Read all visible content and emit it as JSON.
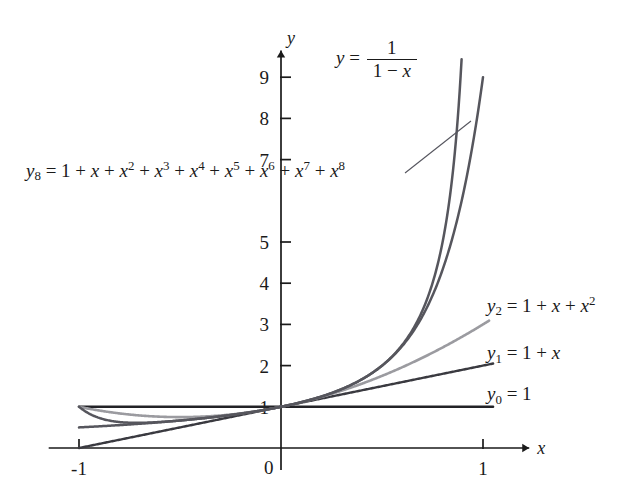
{
  "figure": {
    "background_color": "#ffffff",
    "axis_color": "#1a1a1a",
    "x_axis_name": "x",
    "y_axis_name": "y"
  },
  "labels": {
    "fraction": {
      "lhs": "y",
      "equals": "=",
      "numerator": "1",
      "denominator_one": "1",
      "denominator_minus": "−",
      "denominator_x": "x"
    },
    "y8": {
      "name": "y",
      "subscript": "8",
      "equals": "=",
      "t0": "1",
      "p1": "+",
      "t1": "x",
      "p2": "+",
      "t2": "x",
      "e2": "2",
      "p3": "+",
      "t3": "x",
      "e3": "3",
      "p4": "+",
      "t4": "x",
      "e4": "4",
      "p5": "+",
      "t5": "x",
      "e5": "5",
      "p6": "+",
      "t6": "x",
      "e6": "6",
      "p7": "+",
      "t7": "x",
      "e7": "7",
      "p8": "+",
      "t8": "x",
      "e8": "8"
    },
    "y2": {
      "name": "y",
      "subscript": "2",
      "equals": "=",
      "t0": "1",
      "p1": "+",
      "t1": "x",
      "p2": "+",
      "t2": "x",
      "e2": "2"
    },
    "y1": {
      "name": "y",
      "subscript": "1",
      "equals": "=",
      "t0": "1",
      "p1": "+",
      "t1": "x"
    },
    "y0": {
      "name": "y",
      "subscript": "0",
      "equals": "=",
      "t0": "1"
    }
  },
  "chart_data": {
    "type": "line",
    "title": "",
    "xlabel": "x",
    "ylabel": "y",
    "xlim": [
      -1.15,
      1.12
    ],
    "ylim": [
      -0.35,
      9.6
    ],
    "grid": false,
    "legend_position": "inline-annotations",
    "x_ticks": [
      -1,
      0,
      1
    ],
    "x_tick_labels": [
      "-1",
      "0",
      "1"
    ],
    "y_ticks": [
      1,
      2,
      3,
      4,
      5,
      6,
      7,
      8,
      9
    ],
    "y_tick_labels": [
      "1",
      "2",
      "3",
      "4",
      "5",
      "6",
      "7",
      "8",
      "9"
    ],
    "y_tick_labels_hidden": [
      "6"
    ],
    "series": [
      {
        "name": "y0 = 1",
        "expression": "1",
        "color": "#222226",
        "width": 2.4,
        "x_start": -1.0,
        "x_end": 1.05,
        "x": [
          -1,
          -0.75,
          -0.5,
          -0.25,
          0,
          0.25,
          0.5,
          0.75,
          1
        ],
        "values": [
          1,
          1,
          1,
          1,
          1,
          1,
          1,
          1,
          1
        ]
      },
      {
        "name": "y1 = 1 + x",
        "expression": "1+x",
        "color": "#3a3a40",
        "width": 2.4,
        "x_start": -1.0,
        "x_end": 1.05,
        "x": [
          -1,
          -0.75,
          -0.5,
          -0.25,
          0,
          0.25,
          0.5,
          0.75,
          1
        ],
        "values": [
          0,
          0.25,
          0.5,
          0.75,
          1,
          1.25,
          1.5,
          1.75,
          2
        ]
      },
      {
        "name": "y2 = 1 + x + x^2",
        "expression": "1+x+x^2",
        "color": "#9b9ba0",
        "width": 2.6,
        "x_start": -1.0,
        "x_end": 1.03,
        "x": [
          -1,
          -0.75,
          -0.5,
          -0.25,
          0,
          0.25,
          0.5,
          0.75,
          1
        ],
        "values": [
          1,
          0.8125,
          0.75,
          0.8125,
          1,
          1.3125,
          1.75,
          2.3125,
          3
        ]
      },
      {
        "name": "y8 = 1 + x + x^2 + ... + x^8",
        "expression": "sum x^k, k=0..8",
        "color": "#56565d",
        "width": 2.5,
        "x_start": -1.0,
        "x_end": 1.0,
        "x": [
          -1,
          -0.75,
          -0.5,
          -0.25,
          0,
          0.25,
          0.5,
          0.75,
          0.9,
          1
        ],
        "values": [
          1,
          0.6,
          0.666,
          0.8,
          1,
          1.333,
          1.996,
          3.7,
          6.1,
          9
        ]
      },
      {
        "name": "y = 1/(1-x)",
        "expression": "1/(1-x)",
        "color": "#56565d",
        "width": 2.5,
        "x_start": -1.0,
        "x_end": 0.894,
        "x": [
          -1,
          -0.75,
          -0.5,
          -0.25,
          0,
          0.25,
          0.5,
          0.75,
          0.85,
          0.89
        ],
        "values": [
          0.5,
          0.571,
          0.667,
          0.8,
          1,
          1.333,
          2,
          4,
          6.67,
          9.09
        ]
      }
    ],
    "annotations": [
      {
        "text": "y = 1/(1-x)",
        "x_px": 336,
        "y_px": 38
      },
      {
        "text": "y8 = 1 + x + x^2 + x^3 + x^4 + x^5 + x^6 + x^7 + x^8",
        "x_px": 26,
        "y_px": 160
      },
      {
        "text": "y2 = 1 + x + x^2",
        "x_px": 487,
        "y_px": 295
      },
      {
        "text": "y1 = 1 + x",
        "x_px": 487,
        "y_px": 343
      },
      {
        "text": "y0 = 1",
        "x_px": 487,
        "y_px": 384
      }
    ],
    "leader_line": {
      "x1": 405,
      "y1": 173,
      "x2": 471,
      "y2": 121
    }
  }
}
